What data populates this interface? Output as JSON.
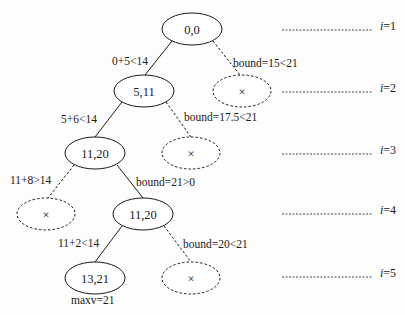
{
  "diagram": {
    "type": "branch-and-bound search tree",
    "colors": {
      "stroke": "#1a1a1a",
      "background": "#fdfdfd"
    },
    "nodes": [
      {
        "id": "n0",
        "label": "0,0",
        "level": 1,
        "pruned": false
      },
      {
        "id": "n1",
        "label": "5,11",
        "level": 2,
        "pruned": false
      },
      {
        "id": "n2",
        "label": "×",
        "level": 2,
        "pruned": true
      },
      {
        "id": "n3",
        "label": "11,20",
        "level": 3,
        "pruned": false
      },
      {
        "id": "n4",
        "label": "×",
        "level": 3,
        "pruned": true
      },
      {
        "id": "n5",
        "label": "×",
        "level": 4,
        "pruned": true
      },
      {
        "id": "n6",
        "label": "11,20",
        "level": 4,
        "pruned": false
      },
      {
        "id": "n7",
        "label": "13,21",
        "level": 5,
        "pruned": false
      },
      {
        "id": "n8",
        "label": "×",
        "level": 5,
        "pruned": true
      }
    ],
    "edges": [
      {
        "from": "n0",
        "to": "n1",
        "label": "0+5<14",
        "style": "solid"
      },
      {
        "from": "n0",
        "to": "n2",
        "label": "bound=15<21",
        "style": "dashed"
      },
      {
        "from": "n1",
        "to": "n3",
        "label": "5+6<14",
        "style": "solid"
      },
      {
        "from": "n1",
        "to": "n4",
        "label": "bound=17.5<21",
        "style": "dashed"
      },
      {
        "from": "n3",
        "to": "n5",
        "label": "11+8>14",
        "style": "dashed"
      },
      {
        "from": "n3",
        "to": "n6",
        "label": "bound=21>0",
        "style": "solid"
      },
      {
        "from": "n6",
        "to": "n7",
        "label": "11+2<14",
        "style": "solid"
      },
      {
        "from": "n6",
        "to": "n8",
        "label": "bound=20<21",
        "style": "dashed"
      }
    ],
    "result_label": "maxv=21",
    "levels": [
      {
        "var": "i",
        "eq": "=1"
      },
      {
        "var": "i",
        "eq": "=2"
      },
      {
        "var": "i",
        "eq": "=3"
      },
      {
        "var": "i",
        "eq": "=4"
      },
      {
        "var": "i",
        "eq": "=5"
      }
    ]
  }
}
